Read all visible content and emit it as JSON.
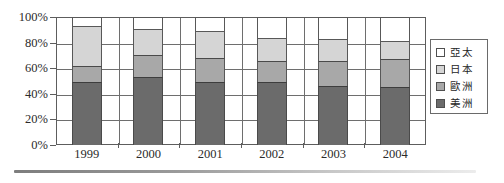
{
  "chart_data": {
    "type": "bar",
    "subtype": "100% stacked column",
    "title": "",
    "xlabel": "",
    "ylabel": "",
    "ylim": [
      0,
      100
    ],
    "yticks": [
      "0%",
      "20%",
      "40%",
      "60%",
      "80%",
      "100%"
    ],
    "ytick_values": [
      0,
      20,
      40,
      60,
      80,
      100
    ],
    "grid": true,
    "legend_position": "right",
    "categories": [
      "1999",
      "2000",
      "2001",
      "2002",
      "2003",
      "2004"
    ],
    "series": [
      {
        "name": "美洲",
        "key": "americas",
        "color": "#6b6b6b",
        "values": [
          49,
          53,
          49,
          49,
          46,
          45
        ]
      },
      {
        "name": "歐洲",
        "key": "europe",
        "color": "#a8a8a8",
        "values": [
          13,
          17,
          19,
          17,
          20,
          22
        ]
      },
      {
        "name": "日本",
        "key": "japan",
        "color": "#d5d5d5",
        "values": [
          31,
          21,
          21,
          18,
          17,
          14
        ]
      },
      {
        "name": "亞太",
        "key": "asia-pacific",
        "color": "#ffffff",
        "values": [
          7,
          9,
          11,
          16,
          17,
          19
        ]
      }
    ],
    "stack_tops": {
      "1999": [
        49,
        62,
        93,
        100
      ],
      "2000": [
        53,
        70,
        91,
        100
      ],
      "2001": [
        49,
        68,
        89,
        100
      ],
      "2002": [
        49,
        66,
        84,
        100
      ],
      "2003": [
        46,
        66,
        83,
        100
      ],
      "2004": [
        45,
        67,
        81,
        100
      ]
    }
  },
  "legend": {
    "items": [
      {
        "label": "亞太",
        "swatch": "#ffffff"
      },
      {
        "label": "日本",
        "swatch": "#d5d5d5"
      },
      {
        "label": "歐洲",
        "swatch": "#a8a8a8"
      },
      {
        "label": "美洲",
        "swatch": "#6b6b6b"
      }
    ]
  },
  "colors": {
    "axis": "#5d5d5d",
    "grid": "#6e6e6e",
    "text": "#2b2b2b",
    "background": "#ffffff"
  }
}
